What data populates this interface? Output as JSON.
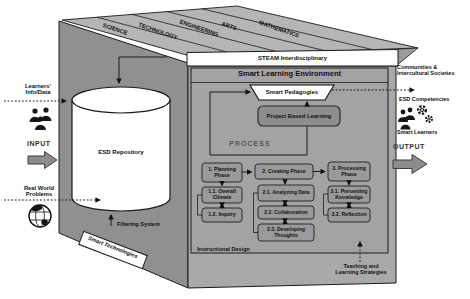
{
  "colors": {
    "top_face": "#b5b5b5",
    "left_face": "#909090",
    "front_face": "#a9a9a9",
    "inner_box": "#a3a3a3",
    "phase_box": "#9a9a9a",
    "pbl_box": "#8d8d8d",
    "block_arrow": "#8c8c8c",
    "line": "#1a1a1a"
  },
  "steam": {
    "strips": [
      "SCIENCE",
      "TECHNOLOGY",
      "ENGINEERING",
      "ARTS",
      "MATHEMATICS"
    ],
    "bar": "STEAM Interdisciplinary"
  },
  "sle": {
    "title": "Smart Learning Environment",
    "pedagogies": "Smart Pedagogies",
    "pbl": "Project Based Learning",
    "process": "PROCESS",
    "instructional": "Instructional Design"
  },
  "phases": {
    "p1": "1. Planning Phase",
    "p11": "1.1. Overall Climate",
    "p12": "1.2. Inquiry",
    "p2": "2. Creating Phase",
    "p21": "2.1. Analyzing Data",
    "p22": "2.2. Collaboration",
    "p23": "2.3. Developing Thoughts",
    "p3": "3. Processing Phase",
    "p31": "3.1. Presenting Knowledge",
    "p32": "3.2. Reflection"
  },
  "left": {
    "learners": "Learners'\nInfo/Data",
    "input": "INPUT",
    "real_world": "Real World\nProblems",
    "repository": "ESD Repository",
    "filtering": "Filtering System",
    "smart_tech": "Smart Technologies"
  },
  "right": {
    "communities": "Communities &\nIntercultural Societies",
    "competencies": "ESD Competencies",
    "smart_learners": "Smart Learners",
    "output": "OUTPUT"
  },
  "bottom": {
    "teaching": "Teaching and\nLearning Strategies"
  }
}
